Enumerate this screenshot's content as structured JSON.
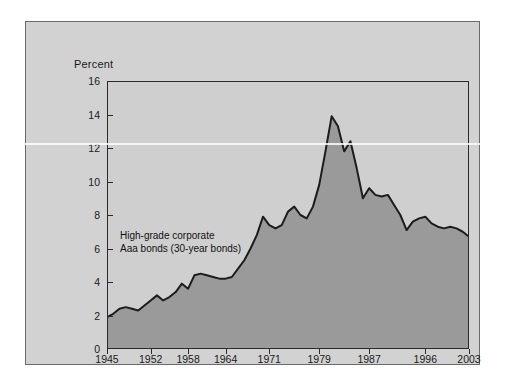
{
  "chart_data": {
    "type": "area",
    "title": "",
    "subtitle": "",
    "xlabel": "",
    "ylabel": "Percent",
    "ylim": [
      0,
      16
    ],
    "xlim": [
      1945,
      2003
    ],
    "yticks": [
      0,
      2,
      4,
      6,
      8,
      10,
      12,
      14,
      16
    ],
    "xticks": [
      1945,
      1952,
      1958,
      1964,
      1971,
      1979,
      1987,
      1996,
      2003
    ],
    "grid": false,
    "legend_position": "none",
    "annotations": [
      {
        "text_line_1": "High-grade corporate",
        "text_line_2": "Aaa bonds (30-year bonds)",
        "x": 1950,
        "y": 6.2
      }
    ],
    "series": [
      {
        "name": "High-grade corporate Aaa bonds (30-year bonds)",
        "line_color": "#1c1c1c",
        "fill_color": "#9a9a9a",
        "x": [
          1945,
          1946,
          1947,
          1948,
          1949,
          1950,
          1951,
          1952,
          1953,
          1954,
          1955,
          1956,
          1957,
          1958,
          1959,
          1960,
          1961,
          1962,
          1963,
          1964,
          1965,
          1966,
          1967,
          1968,
          1969,
          1970,
          1971,
          1972,
          1973,
          1974,
          1975,
          1976,
          1977,
          1978,
          1979,
          1980,
          1981,
          1982,
          1983,
          1984,
          1985,
          1986,
          1987,
          1988,
          1989,
          1990,
          1991,
          1992,
          1993,
          1994,
          1995,
          1996,
          1997,
          1998,
          1999,
          2000,
          2001,
          2002,
          2003
        ],
        "values": [
          1.9,
          2.1,
          2.4,
          2.5,
          2.4,
          2.3,
          2.6,
          2.9,
          3.2,
          2.9,
          3.1,
          3.4,
          3.9,
          3.6,
          4.4,
          4.5,
          4.4,
          4.3,
          4.2,
          4.2,
          4.3,
          4.8,
          5.3,
          6.0,
          6.8,
          7.9,
          7.4,
          7.2,
          7.4,
          8.2,
          8.5,
          8.0,
          7.8,
          8.5,
          9.8,
          11.8,
          13.9,
          13.3,
          11.8,
          12.4,
          10.8,
          9.0,
          9.6,
          9.2,
          9.1,
          9.2,
          8.6,
          8.0,
          7.1,
          7.6,
          7.8,
          7.9,
          7.5,
          7.3,
          7.2,
          7.3,
          7.2,
          7.0,
          6.7
        ]
      }
    ]
  },
  "chart": {
    "y_axis_title": "Percent",
    "y_tick_labels": [
      "16",
      "14",
      "12",
      "10",
      "8",
      "6",
      "4",
      "2",
      "0"
    ],
    "x_tick_labels": [
      "1945",
      "1952",
      "1958",
      "1964",
      "1971",
      "1979",
      "1987",
      "1996",
      "2003"
    ],
    "annotation_line_1": "High-grade corporate",
    "annotation_line_2": "Aaa bonds (30-year bonds)"
  },
  "colors": {
    "page_background": "#ffffff",
    "figure_background": "#d2d2d2",
    "plot_background": "#cfcfcf",
    "area_fill": "#9a9a9a",
    "line": "#1c1c1c",
    "axis": "#2b2b2b",
    "text": "#1a1a1a"
  }
}
